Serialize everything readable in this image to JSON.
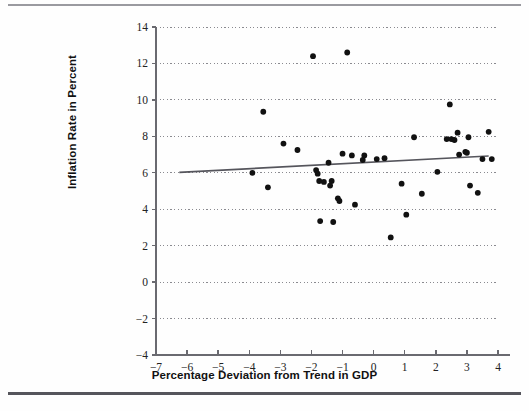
{
  "chart_data": {
    "type": "scatter",
    "title": "",
    "xlabel": "Percentage Deviation from Trend in GDP",
    "ylabel": "Inflation Rate in Percent",
    "xlim": [
      -7,
      4
    ],
    "ylim": [
      -4,
      14
    ],
    "xticks": [
      -7,
      -6,
      -5,
      -4,
      -3,
      -2,
      -1,
      0,
      1,
      2,
      3,
      4
    ],
    "xtick_labels": [
      "−7",
      "−6",
      "−5",
      "−4",
      "−3",
      "−2",
      "−1",
      "0",
      "1",
      "2",
      "3",
      "4"
    ],
    "yticks": [
      -4,
      -2,
      0,
      2,
      4,
      6,
      8,
      10,
      12,
      14
    ],
    "ytick_labels": [
      "−4",
      "−2",
      "0",
      "2",
      "4",
      "6",
      "8",
      "10",
      "12",
      "14"
    ],
    "grid": "horizontal-dotted",
    "legend": "none",
    "marker": "filled-circle",
    "marker_color": "#111111",
    "points": [
      [
        -3.9,
        6.0
      ],
      [
        -3.55,
        9.35
      ],
      [
        -3.4,
        5.2
      ],
      [
        -2.9,
        7.6
      ],
      [
        -2.45,
        7.25
      ],
      [
        -1.95,
        12.4
      ],
      [
        -1.85,
        6.15
      ],
      [
        -1.8,
        5.95
      ],
      [
        -1.75,
        5.55
      ],
      [
        -1.72,
        3.35
      ],
      [
        -1.6,
        5.5
      ],
      [
        -1.45,
        6.55
      ],
      [
        -1.4,
        5.3
      ],
      [
        -1.35,
        5.55
      ],
      [
        -1.3,
        3.3
      ],
      [
        -1.15,
        4.6
      ],
      [
        -1.1,
        4.45
      ],
      [
        -1.0,
        7.05
      ],
      [
        -0.85,
        12.6
      ],
      [
        -0.7,
        6.95
      ],
      [
        -0.6,
        4.25
      ],
      [
        -0.35,
        6.7
      ],
      [
        -0.3,
        6.95
      ],
      [
        0.1,
        6.75
      ],
      [
        0.35,
        6.8
      ],
      [
        0.55,
        2.45
      ],
      [
        0.9,
        5.4
      ],
      [
        1.05,
        3.7
      ],
      [
        1.3,
        7.95
      ],
      [
        1.55,
        4.85
      ],
      [
        2.05,
        6.05
      ],
      [
        2.35,
        7.85
      ],
      [
        2.45,
        9.75
      ],
      [
        2.5,
        7.85
      ],
      [
        2.6,
        7.8
      ],
      [
        2.7,
        8.2
      ],
      [
        2.75,
        7.0
      ],
      [
        2.95,
        7.15
      ],
      [
        3.0,
        7.1
      ],
      [
        3.05,
        7.95
      ],
      [
        3.1,
        5.3
      ],
      [
        3.35,
        4.9
      ],
      [
        3.5,
        6.75
      ],
      [
        3.7,
        8.25
      ],
      [
        3.8,
        6.75
      ]
    ],
    "trendline": {
      "x_start": -6.25,
      "y_start": 6.02,
      "x_end": 3.7,
      "y_end": 6.92,
      "color": "#55555c"
    }
  }
}
